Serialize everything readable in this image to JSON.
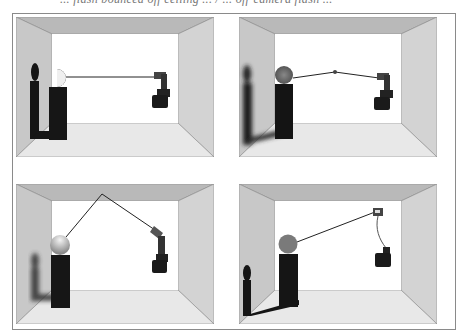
{
  "page": {
    "caption_fragment": "... flash bounced off ceiling ... / ... off-camera flash ...",
    "figure_description": "Four diagrams of a room showing a subject on a pedestal with a camera and flash in different lighting setups"
  },
  "panels": [
    {
      "id": "top-left",
      "setup": "direct-flash-on-camera",
      "shadow": "hard-sharp",
      "sphere_style": "half-lit"
    },
    {
      "id": "top-right",
      "setup": "flash-through-diffuser",
      "shadow": "soft",
      "sphere_style": "soft-gradient"
    },
    {
      "id": "bottom-left",
      "setup": "bounce-off-ceiling",
      "shadow": "soft-faint",
      "sphere_style": "top-lit"
    },
    {
      "id": "bottom-right",
      "setup": "off-camera-flash-cord",
      "shadow": "hard-angled",
      "sphere_style": "side-lit"
    }
  ],
  "colors": {
    "ceiling": "#b9b9b9",
    "left_wall": "#c8c8c8",
    "right_wall": "#d2d2d2",
    "floor": "#e6e6e6",
    "back_wall": "#ffffff",
    "object": "#1a1a1a",
    "frame": "#8a8a8a"
  }
}
